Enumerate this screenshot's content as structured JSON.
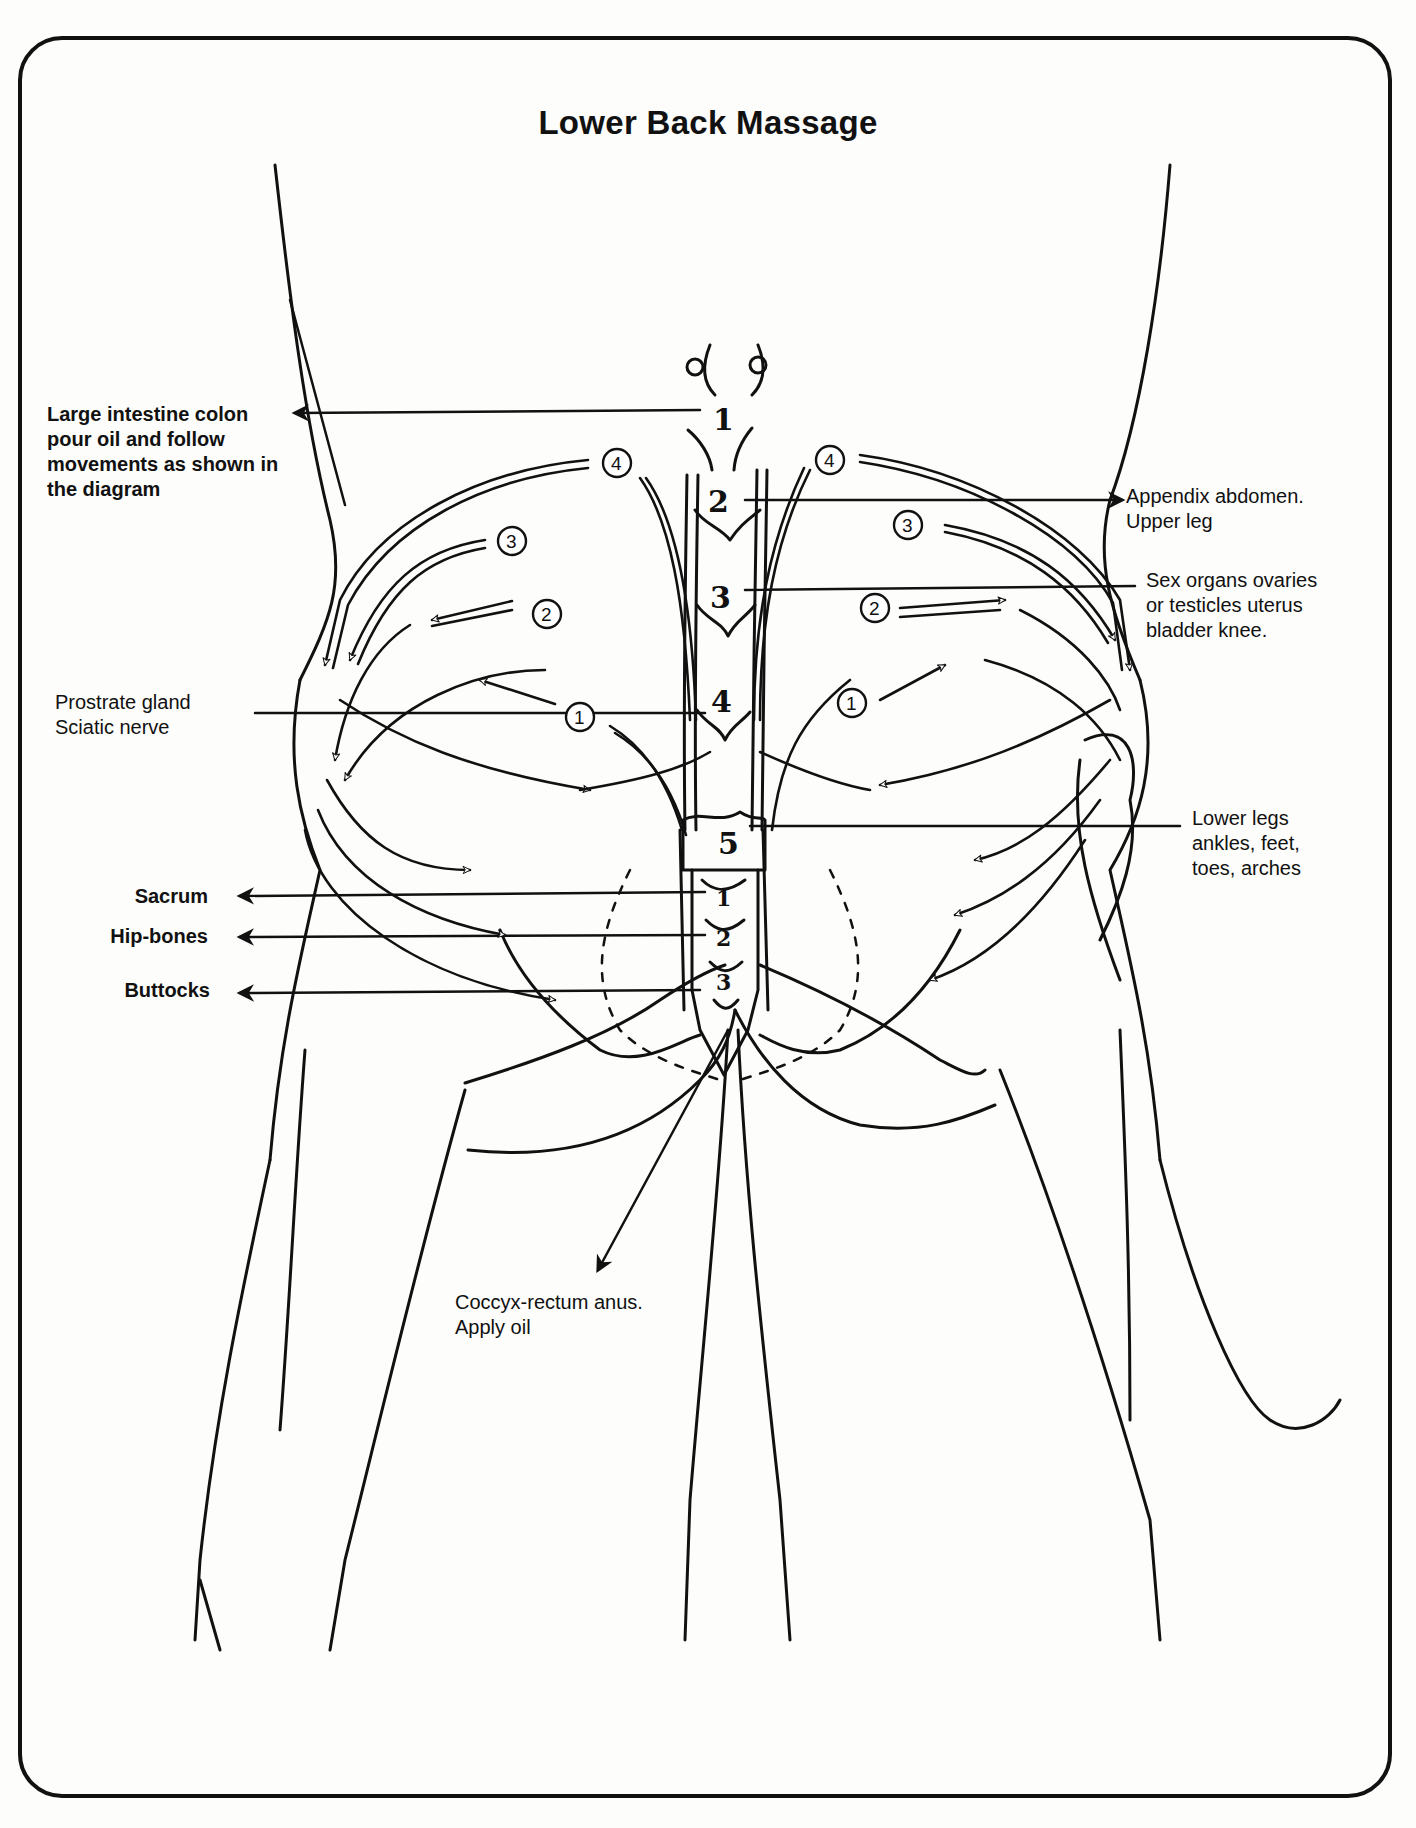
{
  "title": "Lower Back Massage",
  "labels": {
    "large_intestine": "Large intestine colon\npour oil and follow\nmovements as shown in\nthe diagram",
    "appendix": "Appendix abdomen.\nUpper leg",
    "sex_organs": "Sex organs ovaries\nor testicles uterus\nbladder knee.",
    "prostrate": "Prostrate gland\nSciatic nerve",
    "lower_legs": "Lower legs\nankles, feet,\ntoes, arches",
    "sacrum": "Sacrum",
    "hip_bones": "Hip-bones",
    "buttocks": "Buttocks",
    "coccyx": "Coccyx-rectum anus.\nApply oil"
  },
  "spine_numbers": [
    "1",
    "2",
    "3",
    "4",
    "5"
  ],
  "sacrum_numbers": [
    "1",
    "2",
    "3"
  ],
  "circled_steps": {
    "left": [
      "4",
      "3",
      "2",
      "1"
    ],
    "right": [
      "4",
      "3",
      "2",
      "1"
    ]
  },
  "colors": {
    "ink": "#111111",
    "paper": "#fdfdfb"
  }
}
